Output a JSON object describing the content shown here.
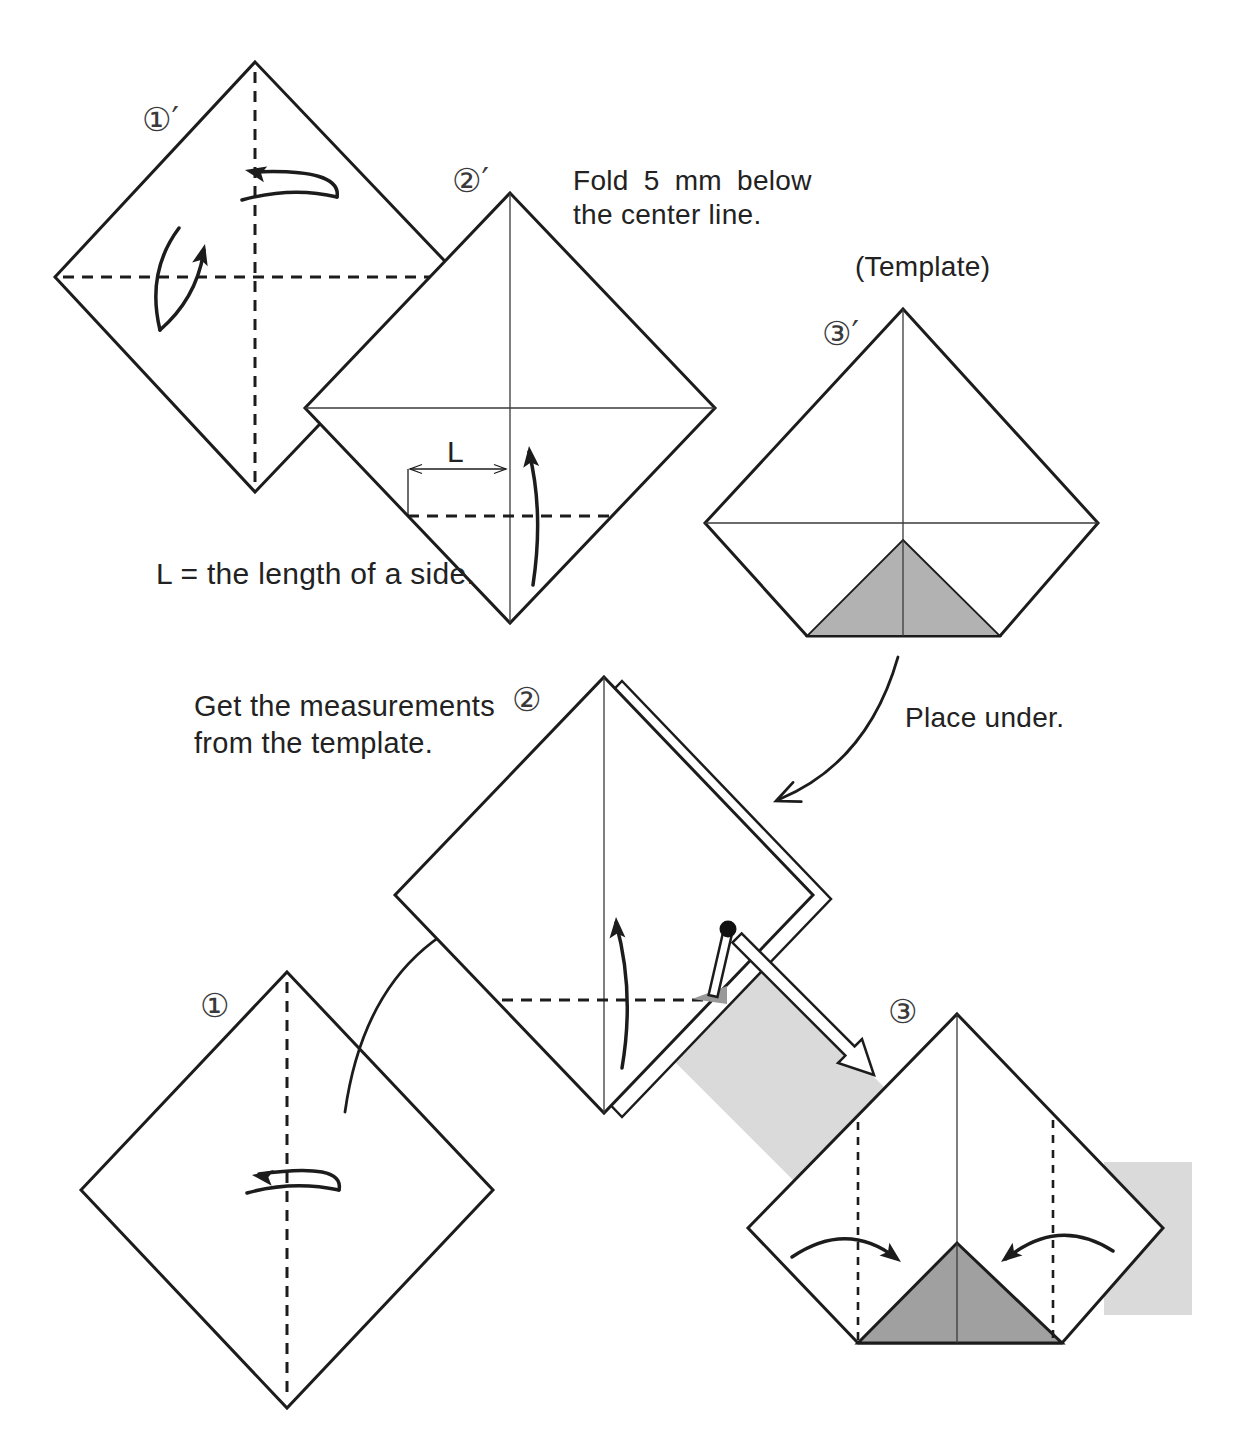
{
  "steps": {
    "s1_prime": {
      "label": "①′"
    },
    "s2_prime": {
      "label": "②′"
    },
    "s3_prime": {
      "label": "③′"
    },
    "s1": {
      "label": "①"
    },
    "s2": {
      "label": "②"
    },
    "s3": {
      "label": "③"
    }
  },
  "texts": {
    "fold_note_line1": "Fold 5 mm below",
    "fold_note_line2": "the center line.",
    "template_caption": "(Template)",
    "length_note": "L = the length of a side.",
    "length_label": "L",
    "measure_note_line1": "Get the measurements",
    "measure_note_line2": "from the template.",
    "place_under": "Place under."
  },
  "colors": {
    "background": "#ffffff",
    "line": "#1c1c1c",
    "template_triangle_fill": "#b2b2b2",
    "step3_triangle_fill": "#a0a0a0",
    "pocket_shadow_fill": "#999999",
    "highlight_band_fill": "#dadada"
  },
  "icons": {
    "pin": "pin-with-ball-head",
    "insert_arrow": "hollow-white-arrow",
    "fold_arrows": "curved-fold-arrows"
  }
}
